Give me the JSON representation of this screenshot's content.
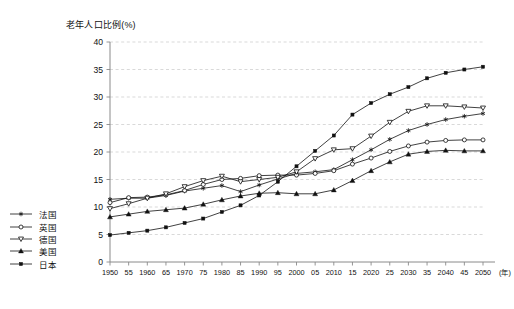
{
  "chart_data": {
    "type": "line",
    "title": "",
    "ylabel": "老年人口比例(%)",
    "xlabel": "(年)",
    "ylim": [
      0,
      40
    ],
    "yticks": [
      0,
      5,
      10,
      15,
      20,
      25,
      30,
      35,
      40
    ],
    "ytick_labels": [
      "0",
      "5",
      "10",
      "15",
      "20",
      "25",
      "30",
      "35",
      "40"
    ],
    "grid": true,
    "grid_style": "dashed-horizontal",
    "legend_position": "outside-left-bottom",
    "x": [
      1950,
      1955,
      1960,
      1965,
      1970,
      1975,
      1980,
      1985,
      1990,
      1995,
      2000,
      2005,
      2010,
      2015,
      2020,
      2025,
      2030,
      2035,
      2040,
      2045,
      2050
    ],
    "xtick_labels": [
      "1950",
      "55",
      "1960",
      "65",
      "1970",
      "75",
      "1980",
      "85",
      "1990",
      "95",
      "2000",
      "05",
      "2010",
      "15",
      "2020",
      "25",
      "2030",
      "35",
      "2040",
      "45",
      "2050"
    ],
    "series": [
      {
        "name": "法国",
        "marker": "asterisk",
        "color": "#111111",
        "values": [
          11.4,
          11.6,
          11.6,
          12.1,
          12.9,
          13.4,
          13.9,
          12.8,
          14.0,
          15.1,
          16.1,
          16.4,
          16.8,
          18.6,
          20.4,
          22.3,
          23.9,
          25.0,
          25.9,
          26.5,
          27.0
        ]
      },
      {
        "name": "英国",
        "marker": "open-circle",
        "color": "#111111",
        "values": [
          10.8,
          11.7,
          11.8,
          12.2,
          13.0,
          14.1,
          15.0,
          15.2,
          15.7,
          15.8,
          15.8,
          16.1,
          16.6,
          17.8,
          18.9,
          20.1,
          21.1,
          21.8,
          22.1,
          22.2,
          22.2
        ]
      },
      {
        "name": "德国",
        "marker": "open-triangle-down",
        "color": "#111111",
        "values": [
          9.7,
          10.6,
          11.6,
          12.4,
          13.7,
          14.8,
          15.6,
          14.6,
          15.0,
          15.4,
          16.4,
          18.8,
          20.4,
          20.6,
          22.9,
          25.4,
          27.4,
          28.4,
          28.4,
          28.2,
          28.0
        ]
      },
      {
        "name": "美国",
        "marker": "filled-triangle-up",
        "color": "#111111",
        "values": [
          8.2,
          8.7,
          9.2,
          9.5,
          9.8,
          10.5,
          11.3,
          12.0,
          12.5,
          12.6,
          12.4,
          12.4,
          13.1,
          14.8,
          16.6,
          18.2,
          19.6,
          20.1,
          20.3,
          20.2,
          20.2
        ]
      },
      {
        "name": "日本",
        "marker": "filled-square",
        "color": "#111111",
        "values": [
          4.9,
          5.3,
          5.7,
          6.3,
          7.1,
          7.9,
          9.1,
          10.3,
          12.1,
          14.6,
          17.4,
          20.2,
          23.0,
          26.8,
          28.9,
          30.5,
          31.8,
          33.4,
          34.4,
          35.0,
          35.5
        ]
      }
    ]
  },
  "legend": {
    "items": [
      {
        "label": "法国",
        "marker": "asterisk"
      },
      {
        "label": "英国",
        "marker": "open-circle"
      },
      {
        "label": "德国",
        "marker": "open-triangle-down"
      },
      {
        "label": "美国",
        "marker": "filled-triangle-up"
      },
      {
        "label": "日本",
        "marker": "filled-square"
      }
    ]
  },
  "axes": {
    "y_title": "老年人口比例(%)",
    "x_unit_label": "(年)"
  },
  "colors": {
    "line": "#111111",
    "grid": "#c9c9c9",
    "axis": "#8a8a8a",
    "text": "#111111"
  }
}
